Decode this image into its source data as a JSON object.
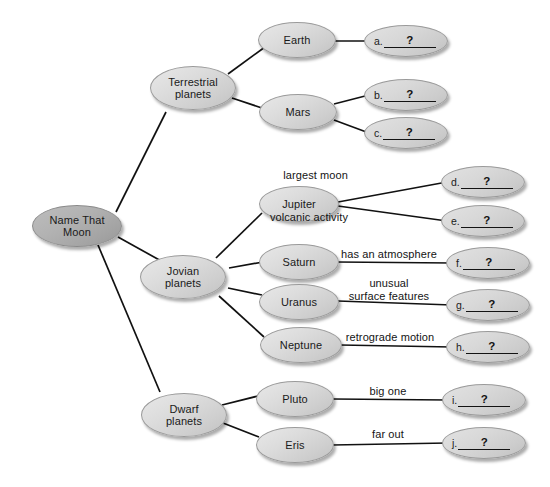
{
  "diagram": {
    "colors": {
      "root_fill": "#a8a8a8",
      "node_fill": "#d6d6d6",
      "edge": "#111111",
      "text": "#1a1a1a",
      "background": "#ffffff"
    },
    "root": {
      "id": "root",
      "label": "Name That\nMoon"
    },
    "categories": [
      {
        "id": "terrestrial",
        "label": "Terrestrial\nplanets"
      },
      {
        "id": "jovian",
        "label": "Jovian\nplanets"
      },
      {
        "id": "dwarf",
        "label": "Dwarf\nplanets"
      }
    ],
    "planets": [
      {
        "id": "earth",
        "label": "Earth",
        "parent": "terrestrial"
      },
      {
        "id": "mars",
        "label": "Mars",
        "parent": "terrestrial"
      },
      {
        "id": "jupiter",
        "label": "Jupiter",
        "parent": "jovian"
      },
      {
        "id": "saturn",
        "label": "Saturn",
        "parent": "jovian"
      },
      {
        "id": "uranus",
        "label": "Uranus",
        "parent": "jovian"
      },
      {
        "id": "neptune",
        "label": "Neptune",
        "parent": "jovian"
      },
      {
        "id": "pluto",
        "label": "Pluto",
        "parent": "dwarf"
      },
      {
        "id": "eris",
        "label": "Eris",
        "parent": "dwarf"
      }
    ],
    "blanks": [
      {
        "id": "a",
        "letter": "a.",
        "question": "?",
        "parent": "earth",
        "caption": ""
      },
      {
        "id": "b",
        "letter": "b.",
        "question": "?",
        "parent": "mars",
        "caption": ""
      },
      {
        "id": "c",
        "letter": "c.",
        "question": "?",
        "parent": "mars",
        "caption": ""
      },
      {
        "id": "d",
        "letter": "d.",
        "question": "?",
        "parent": "jupiter",
        "caption": "largest moon"
      },
      {
        "id": "e",
        "letter": "e.",
        "question": "?",
        "parent": "jupiter",
        "caption": "volcanic activity"
      },
      {
        "id": "f",
        "letter": "f.",
        "question": "?",
        "parent": "saturn",
        "caption": "has an atmosphere"
      },
      {
        "id": "g",
        "letter": "g.",
        "question": "?",
        "parent": "uranus",
        "caption": "unusual\nsurface features"
      },
      {
        "id": "h",
        "letter": "h.",
        "question": "?",
        "parent": "neptune",
        "caption": "retrograde motion"
      },
      {
        "id": "i",
        "letter": "i.",
        "question": "?",
        "parent": "pluto",
        "caption": "big one"
      },
      {
        "id": "j",
        "letter": "j.",
        "question": "?",
        "parent": "eris",
        "caption": "far out"
      }
    ]
  }
}
